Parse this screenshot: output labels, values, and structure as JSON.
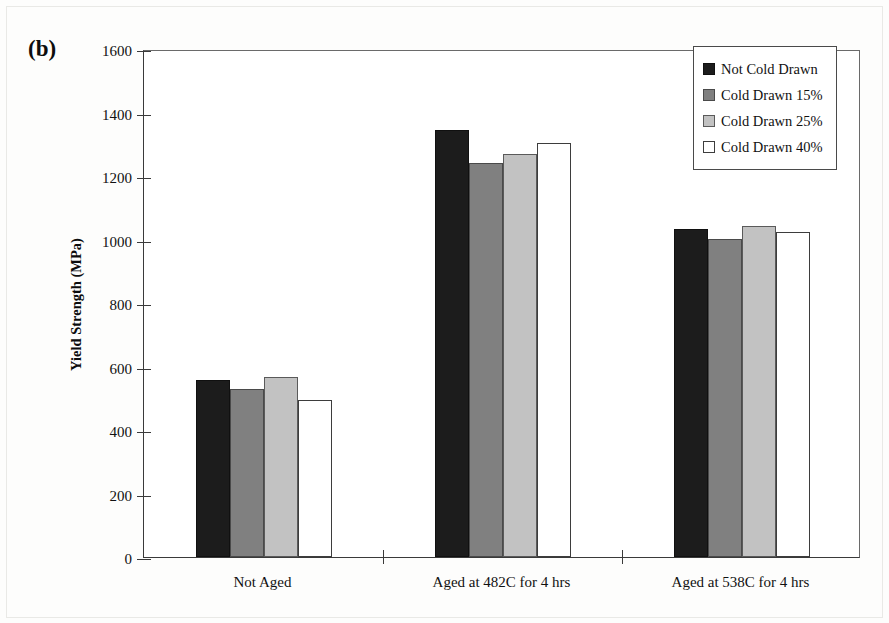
{
  "figure": {
    "panel_label": "(b)"
  },
  "chart_data": {
    "type": "bar",
    "title": "",
    "xlabel": "",
    "ylabel": "Yield Strength (MPa)",
    "ylim": [
      0,
      1600
    ],
    "ytick_step": 200,
    "yticks": [
      0,
      200,
      400,
      600,
      800,
      1000,
      1200,
      1400,
      1600
    ],
    "ytick_labels": [
      "0",
      "200",
      "400",
      "600",
      "800",
      "1000",
      "1200",
      "1400",
      "1600"
    ],
    "grid": false,
    "legend_position": "top-right",
    "categories": [
      "Not Aged",
      "Aged at 482C for 4 hrs",
      "Aged at 538C for 4 hrs"
    ],
    "series": [
      {
        "name": "Not Cold Drawn",
        "color": "#1c1c1c",
        "values": [
          558,
          1345,
          1032
        ]
      },
      {
        "name": "Cold Drawn 15%",
        "color": "#808080",
        "values": [
          530,
          1242,
          1003
        ]
      },
      {
        "name": "Cold Drawn 25%",
        "color": "#c2c2c2",
        "values": [
          566,
          1270,
          1044
        ]
      },
      {
        "name": "Cold Drawn 40%",
        "color": "#ffffff",
        "values": [
          494,
          1303,
          1025
        ]
      }
    ]
  },
  "colors": {
    "axis": "#3a3a3a",
    "text": "#111111",
    "plot_background": "#ffffff",
    "page_background": "#fdfdfc"
  }
}
